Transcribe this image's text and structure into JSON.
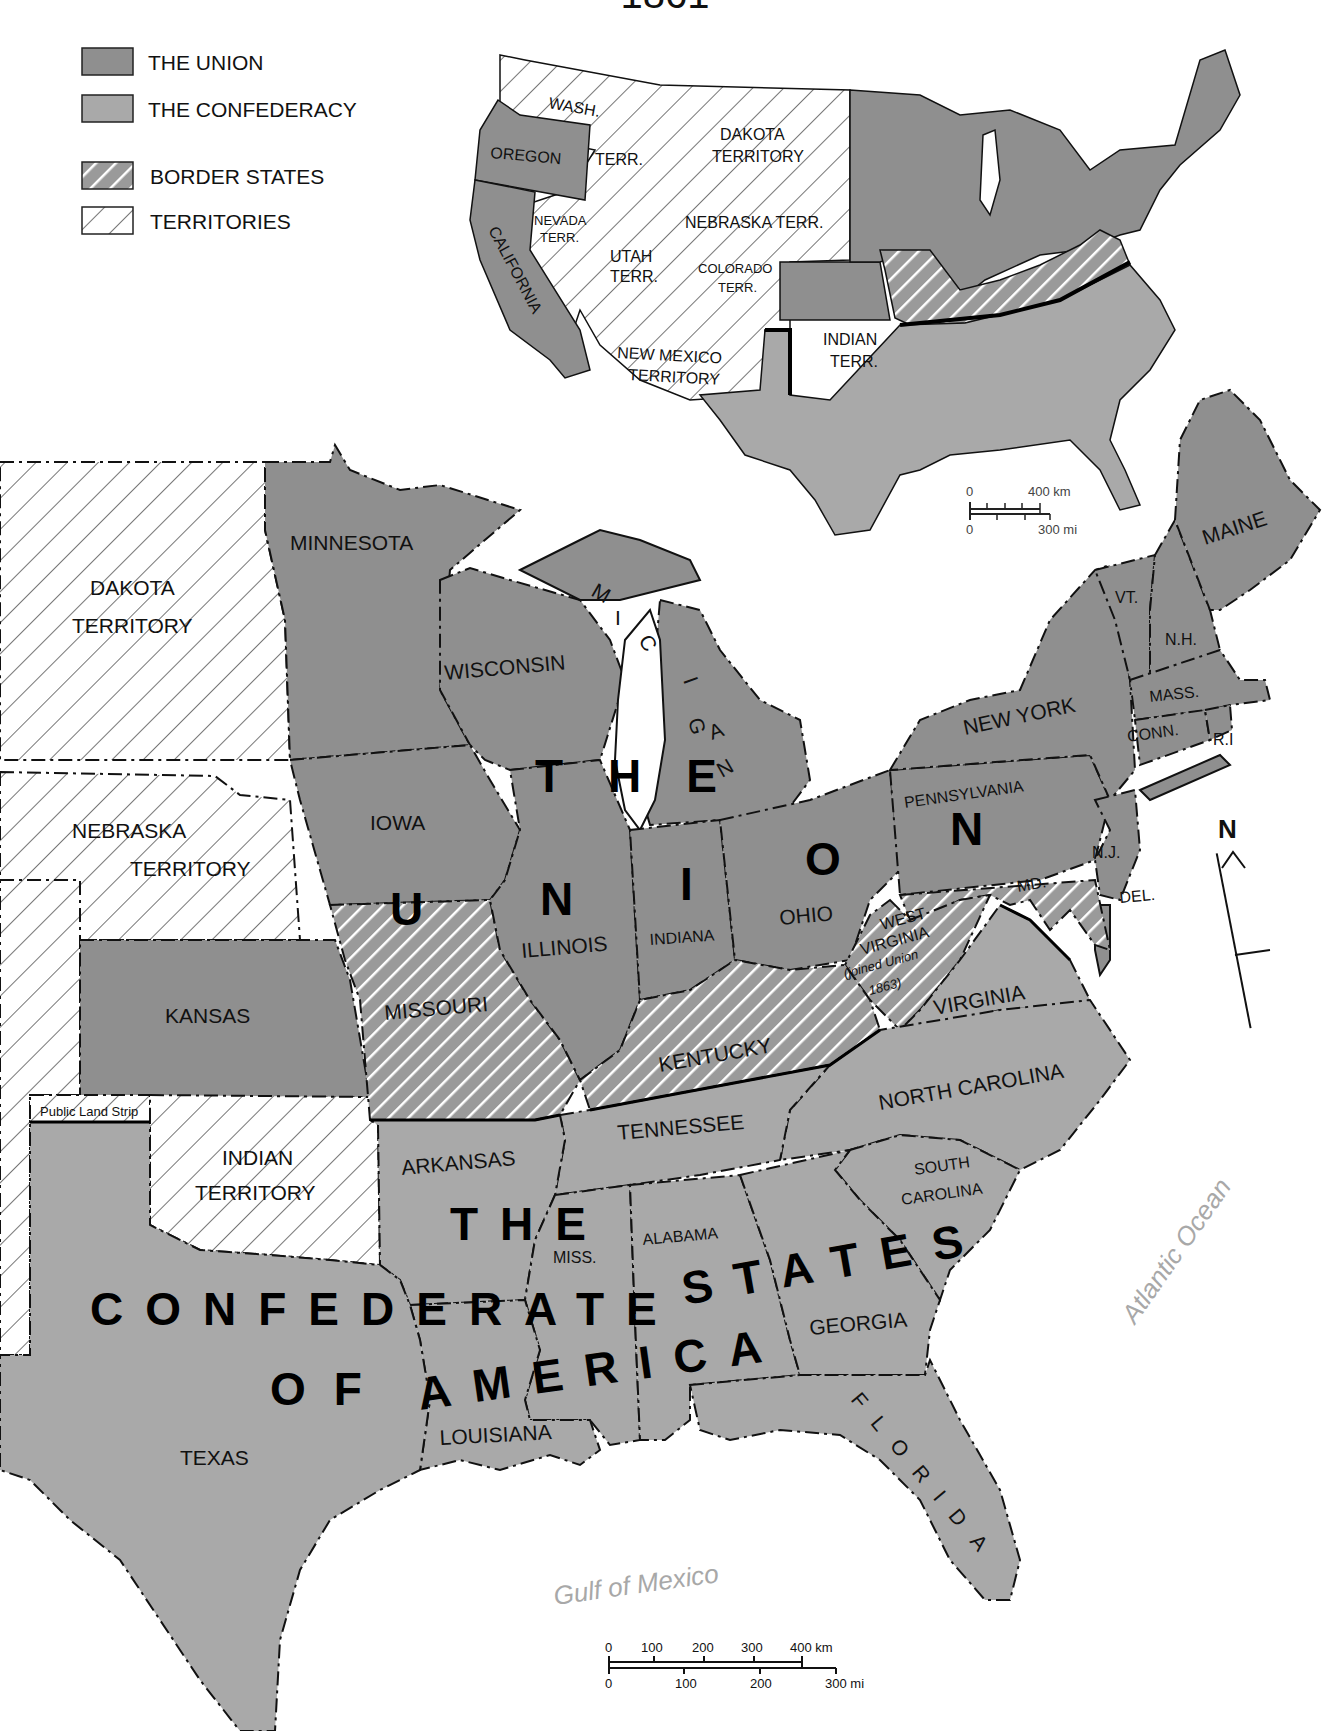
{
  "title": "1861",
  "legend": {
    "items": [
      {
        "label": "THE UNION",
        "style": "union",
        "color": "#8f8f8f"
      },
      {
        "label": "THE CONFEDERACY",
        "style": "confederacy",
        "color": "#a9a9a9"
      },
      {
        "label": "BORDER STATES",
        "style": "border-hatch"
      },
      {
        "label": "TERRITORIES",
        "style": "territory-hatch"
      }
    ]
  },
  "inset_map": {
    "labels": {
      "wash": "WASH.",
      "terr": "TERR.",
      "oregon": "OREGON",
      "dakota1": "DAKOTA",
      "dakota2": "TERRITORY",
      "nevada1": "NEVADA",
      "nevada2": "TERR.",
      "nebraska": "NEBRASKA  TERR.",
      "utah1": "UTAH",
      "utah2": "TERR.",
      "colorado1": "COLORADO",
      "colorado2": "TERR.",
      "california": "CALIFORNIA",
      "newmexico1": "NEW MEXICO",
      "newmexico2": "TERRITORY",
      "indian1": "INDIAN",
      "indian2": "TERR."
    },
    "scale": {
      "km_zero": "0",
      "km_max": "400 km",
      "mi_zero": "0",
      "mi_max": "300 mi"
    }
  },
  "main_map": {
    "states": {
      "minnesota": "MINNESOTA",
      "wisconsin": "WISCONSIN",
      "iowa": "IOWA",
      "illinois": "ILLINOIS",
      "indiana": "INDIANA",
      "ohio": "OHIO",
      "newyork": "NEW YORK",
      "pennsylvania": "PENNSYLVANIA",
      "maine": "MAINE",
      "vt": "VT.",
      "nh": "N.H.",
      "mass": "MASS.",
      "conn": "CONN.",
      "ri": "R.I",
      "nj": "N.J.",
      "del": "DEL.",
      "md": "MD.",
      "kansas": "KANSAS",
      "missouri": "MISSOURI",
      "kentucky": "KENTUCKY",
      "westvirginia1": "WEST",
      "westvirginia2": "VIRGINIA",
      "westvirginia_note1": "(joined Union",
      "westvirginia_note2": "1863)",
      "virginia": "VIRGINIA",
      "northcarolina": "NORTH CAROLINA",
      "tennessee": "TENNESSEE",
      "arkansas": "ARKANSAS",
      "southcarolina1": "SOUTH",
      "southcarolina2": "CAROLINA",
      "miss": "MISS.",
      "alabama": "ALABAMA",
      "georgia": "GEORGIA",
      "louisiana": "LOUISIANA",
      "texas": "TEXAS",
      "florida": "FLORIDA"
    },
    "territories": {
      "dakota1": "DAKOTA",
      "dakota2": "TERRITORY",
      "nebraska1": "NEBRASKA",
      "nebraska2": "TERRITORY",
      "indian1": "INDIAN",
      "indian2": "TERRITORY",
      "public_land_strip": "Public Land Strip"
    },
    "lake": "MICHIGAN",
    "region_labels": {
      "the_union_1": "THE",
      "the_union_2": "UNION",
      "confederacy_1": "THE",
      "confederacy_2": "CONFEDERATE",
      "confederacy_3": "STATES",
      "confederacy_4": "OF",
      "confederacy_5": "AMERICA"
    },
    "water": {
      "gulf": "Gulf of Mexico",
      "atlantic": "Atlantic Ocean"
    },
    "north_arrow": "N",
    "scale": {
      "km_ticks": [
        "0",
        "100",
        "200",
        "300",
        "400 km"
      ],
      "mi_ticks": [
        "0",
        "100",
        "200",
        "300 mi"
      ]
    }
  }
}
